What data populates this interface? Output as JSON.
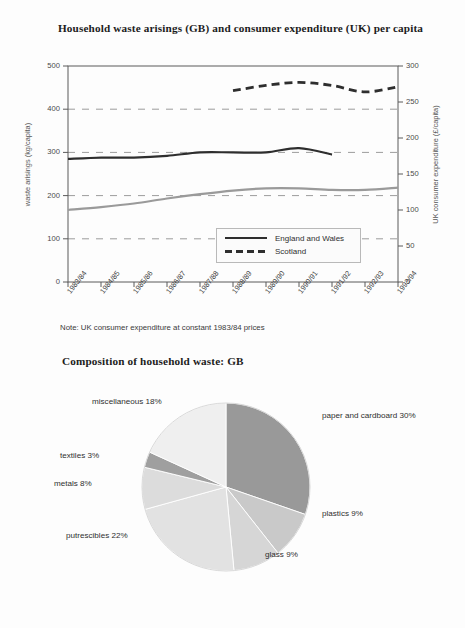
{
  "figure1": {
    "title": "Household waste arisings (GB) and consumer expenditure (UK) per capita",
    "note": "Note: UK consumer expenditure at constant 1983/84 prices",
    "legend": [
      {
        "label": "England and Wales",
        "style": "solid"
      },
      {
        "label": "Scotland",
        "style": "dashed"
      }
    ]
  },
  "figure2": {
    "title": "Composition of household waste: GB"
  },
  "chart_data": [
    {
      "type": "line",
      "title": "Household waste arisings (GB) and consumer expenditure (UK) per capita",
      "xlabel": "",
      "ylabel": "waste arisings (kg/capita)",
      "y2label": "UK consumer expenditure (£/capita)",
      "ylim": [
        0,
        500
      ],
      "y2lim": [
        0,
        300
      ],
      "yticks": [
        0,
        100,
        200,
        300,
        400,
        500
      ],
      "y2ticks": [
        0,
        50,
        100,
        150,
        200,
        250,
        300
      ],
      "grid": true,
      "gridlines": [
        100,
        200,
        300,
        400
      ],
      "legend_position": "inside-bottom-right",
      "categories": [
        "1983/84",
        "1984/85",
        "1985/86",
        "1986/87",
        "1987/88",
        "1988/89",
        "1989/90",
        "1990/91",
        "1991/92",
        "1992/93",
        "1993/94"
      ],
      "series": [
        {
          "name": "England and Wales",
          "axis": "left",
          "unit": "kg/capita",
          "style": "solid",
          "color": "#2e2e2e",
          "x": [
            "1983/84",
            "1984/85",
            "1985/86",
            "1986/87",
            "1987/88",
            "1988/89",
            "1989/90",
            "1990/91",
            "1991/92"
          ],
          "values": [
            285,
            288,
            288,
            292,
            300,
            300,
            300,
            310,
            295
          ]
        },
        {
          "name": "Scotland",
          "axis": "left",
          "unit": "kg/capita",
          "style": "dashed",
          "color": "#2e2e2e",
          "x": [
            "1988/89",
            "1989/90",
            "1990/91",
            "1991/92",
            "1992/93",
            "1993/94"
          ],
          "values": [
            443,
            455,
            462,
            455,
            440,
            452
          ]
        },
        {
          "name": "UK consumer expenditure",
          "axis": "right",
          "unit": "£/capita",
          "style": "solid",
          "color": "#9a9a9a",
          "x": [
            "1983/84",
            "1984/85",
            "1985/86",
            "1986/87",
            "1987/88",
            "1988/89",
            "1989/90",
            "1990/91",
            "1991/92",
            "1992/93",
            "1993/94"
          ],
          "values": [
            100,
            104,
            109,
            116,
            122,
            127,
            130,
            130,
            128,
            128,
            131
          ]
        }
      ],
      "note": "Note: UK consumer expenditure at constant 1983/84 prices"
    },
    {
      "type": "pie",
      "title": "Composition of household waste: GB",
      "unit": "%",
      "labels": [
        "paper and cardboard",
        "plastics",
        "glass",
        "putrescibles",
        "metals",
        "textiles",
        "miscellaneous"
      ],
      "values": [
        30,
        9,
        9,
        22,
        8,
        3,
        18
      ],
      "slice_labels": [
        "paper and cardboard 30%",
        "plastics 9%",
        "glass 9%",
        "putrescibles 22%",
        "metals 8%",
        "textiles 3%",
        "miscellaneous 18%"
      ],
      "colors": [
        "#999999",
        "#c9c9c9",
        "#d6d6d6",
        "#e2e2e2",
        "#dcdcdc",
        "#9f9f9f",
        "#efefef"
      ],
      "start_angle_deg": 0,
      "direction": "clockwise"
    }
  ]
}
